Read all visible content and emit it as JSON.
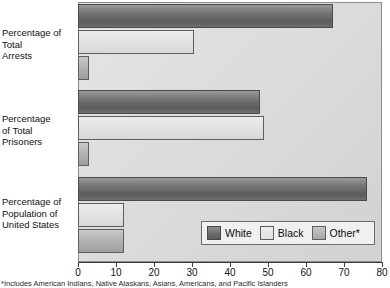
{
  "chart_data": {
    "type": "bar",
    "orientation": "horizontal",
    "title": "",
    "subtitle": "",
    "xlabel": "",
    "ylabel": "",
    "xlim": [
      0,
      80
    ],
    "xticks": [
      0,
      10,
      20,
      30,
      40,
      50,
      60,
      70,
      80
    ],
    "xtick_labels": [
      "0",
      "10",
      "20",
      "30",
      "40",
      "50",
      "60",
      "70",
      "80"
    ],
    "grid": false,
    "legend_position": "inside-bottom-right",
    "categories": [
      "Percentage of Total Arrests",
      "Percentage of Total Prisoners",
      "Percentage of Population of United States"
    ],
    "category_label_lines": [
      [
        "Percentage of",
        "Total",
        "Arrests"
      ],
      [
        "Percentage",
        "of Total",
        "Prisoners"
      ],
      [
        "Percentage of",
        "Population of",
        "United States"
      ]
    ],
    "series": [
      {
        "name": "White",
        "color": "#6f6f6f",
        "values": [
          67,
          48,
          76
        ]
      },
      {
        "name": "Black",
        "color": "#e4e4e4",
        "values": [
          30.5,
          49,
          12
        ]
      },
      {
        "name": "Other*",
        "color": "#ababab",
        "values": [
          3,
          3,
          12
        ]
      }
    ],
    "annotations": [
      "*Includes American Indians, Native Alaskans, Asians, Americans, and Pacific Islanders"
    ]
  },
  "legend": {
    "items": [
      {
        "label": "White"
      },
      {
        "label": "Black"
      },
      {
        "label": "Other*"
      }
    ]
  },
  "footnote": {
    "text": "*Includes American Indians, Native Alaskans, Asians, Americans, and Pacific Islanders"
  },
  "colors": {
    "plot_background": "#dcdcdc",
    "frame_border": "#8d8d8d",
    "axis": "#3a3a3a",
    "white_series": "#6f6f6f",
    "black_series": "#e4e4e4",
    "other_series": "#ababab"
  }
}
